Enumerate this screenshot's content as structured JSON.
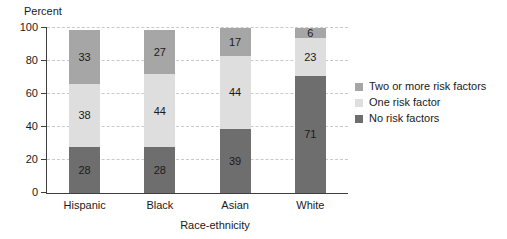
{
  "chart_data": {
    "type": "bar",
    "stacked": true,
    "ylabel": "Percent",
    "xlabel": "Race-ethnicity",
    "categories": [
      "Hispanic",
      "Black",
      "Asian",
      "White"
    ],
    "series": [
      {
        "name": "No risk factors",
        "color": "#6e6e6e",
        "values": [
          28,
          28,
          39,
          71
        ]
      },
      {
        "name": "One risk factor",
        "color": "#dedede",
        "values": [
          38,
          44,
          44,
          23
        ]
      },
      {
        "name": "Two or more risk factors",
        "color": "#a6a6a6",
        "values": [
          33,
          27,
          17,
          6
        ]
      }
    ],
    "legend_order": [
      "Two or more risk factors",
      "One risk factor",
      "No risk factors"
    ],
    "legend_position": "right",
    "ylim": [
      0,
      100
    ],
    "yticks": [
      0,
      20,
      40,
      60,
      80,
      100
    ],
    "grid": "horizontal-dashed",
    "colors": {
      "axis": "#3f3f3f",
      "gridline": "#c9c9c9",
      "text": "#1a1a1a"
    }
  }
}
